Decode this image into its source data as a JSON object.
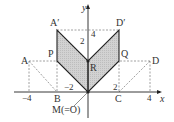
{
  "diagram": {
    "axes": {
      "x_label": "x",
      "y_label": "y"
    },
    "points": {
      "A": "A",
      "B": "B",
      "C": "C",
      "D": "D",
      "A_prime": "A′",
      "D_prime": "D′",
      "P": "P",
      "Q": "Q",
      "R": "R",
      "M": "M(=O)"
    },
    "ticks": {
      "x_neg4": "−4",
      "x_neg2": "−2",
      "x_2": "2",
      "x_4": "4",
      "y_4": "4",
      "seg_2": "2"
    },
    "colors": {
      "shade": "#d4d4d4",
      "line": "#222222",
      "dashed": "#888888"
    }
  }
}
